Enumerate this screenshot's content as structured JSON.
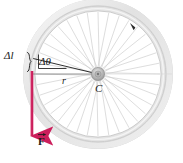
{
  "figure": {
    "canvas": {
      "width": 183,
      "height": 163,
      "background": "#ffffff"
    }
  },
  "labels": {
    "delta_l": "Δl",
    "delta_theta": "Δθ",
    "radius": "r",
    "center": "C",
    "force": "F",
    "rim_mark": "r"
  },
  "colors": {
    "force_vector": "#cc1f5c",
    "force_vector_light": "#e8淡",
    "leader_line": "#1a1a1a",
    "rim_outer": "#c9c9c9",
    "rim_inner": "#d8d8d8",
    "tire": "#e9e9e9",
    "spoke": "#cfcfcf",
    "hub": "#9a9a9a",
    "text": "#1a1a1a",
    "brace": "#1a1a1a"
  },
  "geometry": {
    "hub_center": {
      "x": 98,
      "y": 74
    },
    "tire_outer_radius": 74,
    "tire_inner_radius": 68,
    "rim_outer_radius": 66,
    "rim_inner_radius": 62,
    "hub_radius": 6,
    "spoke_count": 36,
    "radius_line_length": 66,
    "delta_theta_degrees": 14,
    "force_arrow": {
      "x": 32,
      "y_start": 72,
      "y_end": 142,
      "direction": "down",
      "stroke_width": 3
    },
    "arc_segment": {
      "label": "Δl",
      "from_angle_deg": 194,
      "to_angle_deg": 180
    }
  },
  "annotations": [
    {
      "name": "delta-l",
      "text": "Δl",
      "meaning": "arc length traveled by rim point"
    },
    {
      "name": "delta-theta",
      "text": "Δθ",
      "meaning": "angle subtended at hub"
    },
    {
      "name": "radius",
      "text": "r",
      "meaning": "wheel radius from hub to rim"
    },
    {
      "name": "center",
      "text": "C",
      "meaning": "center of wheel / hub"
    },
    {
      "name": "force",
      "text": "F",
      "meaning": "applied tangential force vector, downward"
    }
  ]
}
